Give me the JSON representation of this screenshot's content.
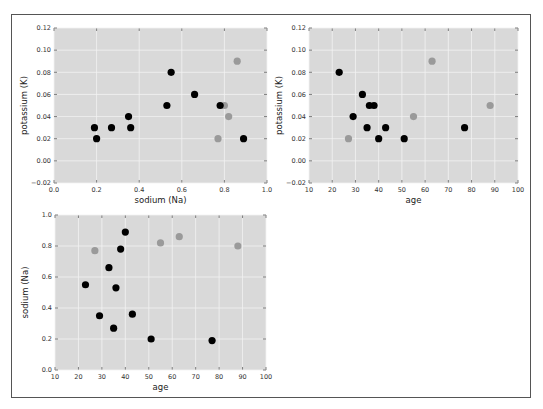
{
  "colors": {
    "plot_bg": "#d9d9d9",
    "grid": "#f2f2f2",
    "class_a": "#000000",
    "class_b": "#9a9a9a",
    "frame": "#555555"
  },
  "chart_data": [
    {
      "id": "na-vs-k",
      "type": "scatter",
      "title": "",
      "xlabel": "sodium (Na)",
      "ylabel": "potassium (K)",
      "xlim": [
        0.0,
        1.0
      ],
      "ylim": [
        -0.02,
        0.12
      ],
      "xticks": [
        "0.0",
        "0.2",
        "0.4",
        "0.6",
        "0.8",
        "1.0"
      ],
      "yticks": [
        "−0.02",
        "0.00",
        "0.02",
        "0.04",
        "0.06",
        "0.08",
        "0.10",
        "0.12"
      ],
      "grid": true,
      "legend": null,
      "series": [
        {
          "name": "class A (black)",
          "color": "#000000",
          "x": [
            0.55,
            0.35,
            0.66,
            0.27,
            0.53,
            0.78,
            0.89,
            0.36,
            0.2,
            0.19
          ],
          "y": [
            0.08,
            0.04,
            0.06,
            0.03,
            0.05,
            0.05,
            0.02,
            0.03,
            0.02,
            0.03
          ]
        },
        {
          "name": "class B (grey)",
          "color": "#9a9a9a",
          "x": [
            0.77,
            0.82,
            0.86,
            0.8
          ],
          "y": [
            0.02,
            0.04,
            0.09,
            0.05
          ]
        }
      ]
    },
    {
      "id": "age-vs-k",
      "type": "scatter",
      "title": "",
      "xlabel": "age",
      "ylabel": "potassium (K)",
      "xlim": [
        10,
        100
      ],
      "ylim": [
        -0.02,
        0.12
      ],
      "xticks": [
        "10",
        "20",
        "30",
        "40",
        "50",
        "60",
        "70",
        "80",
        "90",
        "100"
      ],
      "yticks": [
        "−0.02",
        "0.00",
        "0.02",
        "0.04",
        "0.06",
        "0.08",
        "0.10",
        "0.12"
      ],
      "grid": true,
      "legend": null,
      "series": [
        {
          "name": "class A (black)",
          "color": "#000000",
          "x": [
            23,
            29,
            33,
            35,
            36,
            38,
            40,
            43,
            51,
            77
          ],
          "y": [
            0.08,
            0.04,
            0.06,
            0.03,
            0.05,
            0.05,
            0.02,
            0.03,
            0.02,
            0.03
          ]
        },
        {
          "name": "class B (grey)",
          "color": "#9a9a9a",
          "x": [
            27,
            55,
            63,
            88
          ],
          "y": [
            0.02,
            0.04,
            0.09,
            0.05
          ]
        }
      ]
    },
    {
      "id": "age-vs-na",
      "type": "scatter",
      "title": "",
      "xlabel": "age",
      "ylabel": "sodium (Na)",
      "xlim": [
        10,
        100
      ],
      "ylim": [
        0.0,
        1.0
      ],
      "xticks": [
        "10",
        "20",
        "30",
        "40",
        "50",
        "60",
        "70",
        "80",
        "90",
        "100"
      ],
      "yticks": [
        "0.0",
        "0.2",
        "0.4",
        "0.6",
        "0.8",
        "1.0"
      ],
      "grid": true,
      "legend": null,
      "series": [
        {
          "name": "class A (black)",
          "color": "#000000",
          "x": [
            23,
            29,
            33,
            35,
            36,
            38,
            40,
            43,
            51,
            77
          ],
          "y": [
            0.55,
            0.35,
            0.66,
            0.27,
            0.53,
            0.78,
            0.89,
            0.36,
            0.2,
            0.19
          ]
        },
        {
          "name": "class B (grey)",
          "color": "#9a9a9a",
          "x": [
            27,
            55,
            63,
            88
          ],
          "y": [
            0.77,
            0.82,
            0.86,
            0.8
          ]
        }
      ]
    }
  ]
}
